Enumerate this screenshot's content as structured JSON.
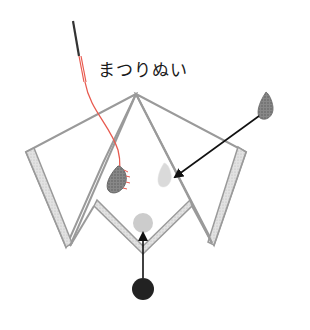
{
  "diagram": {
    "title_label": "まつりぬい",
    "colors": {
      "outline": "#9a9a9a",
      "band_fill": "#dcdcdc",
      "thread": "#e85a4f",
      "needle": "#333333",
      "arrow": "#111111",
      "nose": "#222222",
      "eye_dark": "#7a7a7a",
      "eye_light": "#d8d8d8",
      "mouth_light": "#c8c8c8"
    },
    "elements": [
      {
        "id": "needle",
        "type": "needle"
      },
      {
        "id": "thread",
        "type": "thread"
      },
      {
        "id": "dog-head",
        "type": "folded-paper-outline"
      },
      {
        "id": "left-ear",
        "type": "ear-flap"
      },
      {
        "id": "right-ear",
        "type": "ear-flap"
      },
      {
        "id": "left-eye",
        "type": "teardrop",
        "style": "stitched-dark"
      },
      {
        "id": "right-eye-placement",
        "type": "teardrop",
        "style": "light-target"
      },
      {
        "id": "eye-piece",
        "type": "teardrop",
        "style": "dark-source"
      },
      {
        "id": "nose-placement",
        "type": "circle",
        "style": "light-target"
      },
      {
        "id": "nose-piece",
        "type": "circle",
        "style": "dark-source"
      },
      {
        "id": "arrow-eye",
        "type": "arrow",
        "from": "eye-piece",
        "to": "right-eye-placement"
      },
      {
        "id": "arrow-nose",
        "type": "arrow",
        "from": "nose-piece",
        "to": "nose-placement"
      }
    ]
  }
}
